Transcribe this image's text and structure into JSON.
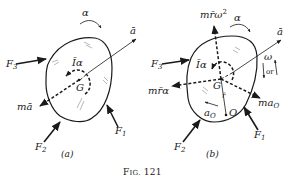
{
  "figure": {
    "caption": "Fig. 121",
    "caption_prefix": "F",
    "caption_smallcaps": "IG.",
    "caption_number": "121",
    "colors": {
      "ink": "#1a1a1a",
      "background": "#ffffff",
      "hatch": "#888888"
    }
  },
  "panel_a": {
    "label": "(a)",
    "forces": {
      "F1": {
        "base": "F",
        "sub": "1"
      },
      "F2": {
        "base": "F",
        "sub": "2"
      },
      "F3": {
        "base": "F",
        "sub": "3"
      }
    },
    "angular_accel": "α",
    "linear_accel": "ā",
    "moment_label": "Īα",
    "center_label": "G",
    "inertia_force": "mā"
  },
  "panel_b": {
    "label": "(b)",
    "forces": {
      "F1": {
        "base": "F",
        "sub": "1"
      },
      "F2": {
        "base": "F",
        "sub": "2"
      },
      "F3": {
        "base": "F",
        "sub": "3"
      }
    },
    "angular_accel": "α",
    "linear_accel": "ā",
    "angular_velocity": "ω",
    "or_label": "or",
    "moment_label": "Īα",
    "center_label": "G",
    "radius_label": "r̄",
    "centripetal_base": "mr̄ω",
    "centripetal_sup": "2",
    "tangential_label": "mr̄α",
    "point_O_label": "O",
    "accel_O_base": "a",
    "accel_O_sub": "O",
    "force_O_base": "ma",
    "force_O_sub": "O"
  }
}
